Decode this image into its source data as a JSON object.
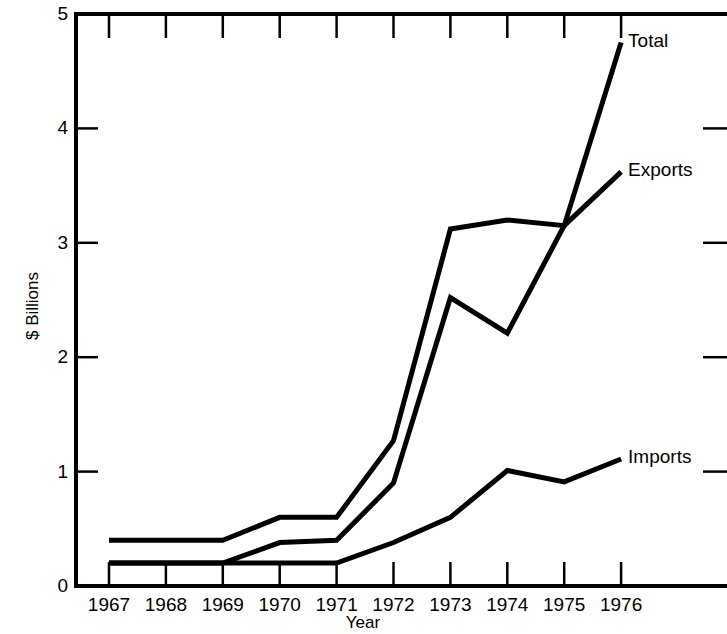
{
  "chart_data": {
    "type": "line",
    "title": "",
    "xlabel": "Year",
    "ylabel": "$ Billions",
    "x": [
      1967,
      1968,
      1969,
      1970,
      1971,
      1972,
      1973,
      1974,
      1975,
      1976
    ],
    "categories": [
      "1967",
      "1968",
      "1969",
      "1970",
      "1971",
      "1972",
      "1973",
      "1974",
      "1975",
      "1976"
    ],
    "xlim": [
      1966.2,
      1976.9
    ],
    "ylim": [
      0,
      5
    ],
    "yticks": [
      0,
      1,
      2,
      3,
      4,
      5
    ],
    "ytick_labels": [
      "0",
      "1",
      "2",
      "3",
      "4",
      "5"
    ],
    "xtick_labels": [
      "1967",
      "1968",
      "1969",
      "1970",
      "1971",
      "1972",
      "1973",
      "1974",
      "1975",
      "1976"
    ],
    "grid": false,
    "legend_position": "inline-right-of-line-end",
    "line_color": "#000000",
    "series": [
      {
        "name": "Total",
        "label": "Total",
        "values": [
          0.4,
          0.4,
          0.4,
          0.6,
          0.6,
          1.27,
          3.12,
          3.2,
          3.15,
          4.75
        ]
      },
      {
        "name": "Exports",
        "label": "Exports",
        "values": [
          0.2,
          0.2,
          0.2,
          0.38,
          0.4,
          0.9,
          2.52,
          2.21,
          3.15,
          3.62
        ]
      },
      {
        "name": "Imports",
        "label": "Imports",
        "values": [
          0.2,
          0.2,
          0.2,
          0.2,
          0.2,
          0.38,
          0.6,
          1.01,
          0.91,
          1.11
        ]
      }
    ]
  },
  "axes": {
    "y_title": "$ Billions",
    "x_title": "Year"
  }
}
